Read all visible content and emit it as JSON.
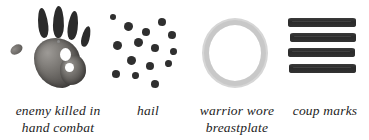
{
  "page": {
    "background_color": "#ffffff",
    "width": 369,
    "height": 140
  },
  "symbols": [
    {
      "id": "handprint",
      "icon_name": "handprint-symbol",
      "caption": "enemy killed in\nhand combat",
      "ink_color": "#2b2b2b",
      "palm_color": "#6a6764"
    },
    {
      "id": "hail",
      "icon_name": "hail-dots-symbol",
      "caption": "hail",
      "ink_color": "#2f2f2f",
      "dot_count": 15
    },
    {
      "id": "ring",
      "icon_name": "ring-breastplate-symbol",
      "caption": "warrior wore\nbreastplate",
      "ink_color": "#d6d6d6"
    },
    {
      "id": "coup-marks",
      "icon_name": "coup-marks-symbol",
      "caption": "coup marks",
      "ink_color": "#2f2f2f",
      "stroke_count": 4
    }
  ]
}
